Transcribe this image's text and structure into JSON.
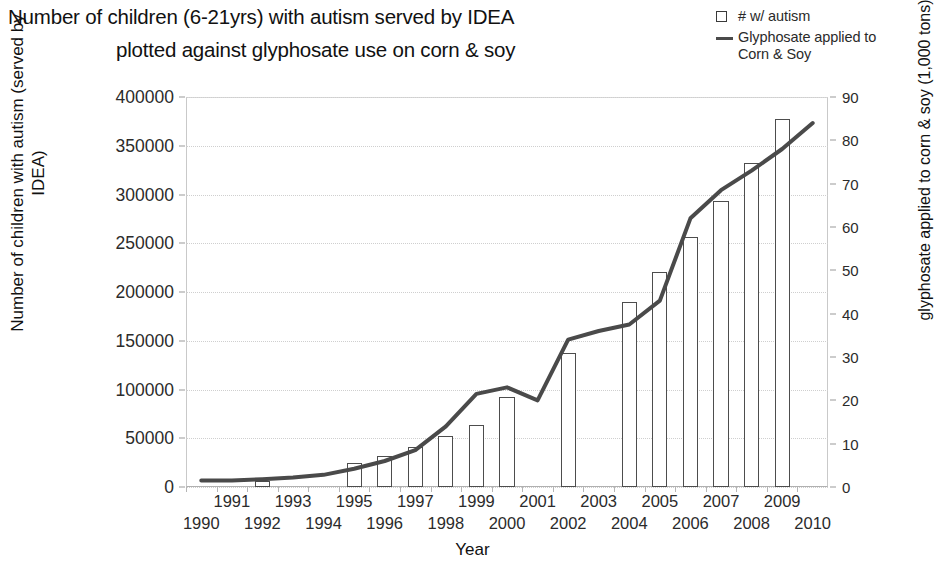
{
  "title": {
    "line1": "Number of children (6-21yrs) with autism served by IDEA",
    "line2": "plotted against glyphosate use on corn & soy"
  },
  "legend": {
    "items": [
      {
        "label": "# w/ autism",
        "marker": "open-square",
        "color": "#3a3a3a"
      },
      {
        "label": "Glyphosate applied to",
        "label2": "Corn & Soy",
        "marker": "line",
        "color": "#4a4a4a"
      }
    ]
  },
  "axes": {
    "x_title": "Year",
    "y_left_title": "Number of children with autism (served by IDEA)",
    "y_right_title": "glyphosate applied to corn & soy (1,000 tons)"
  },
  "chart_data": {
    "type": "bar",
    "title": "Number of children (6-21yrs) with autism served by IDEA plotted against glyphosate use on corn & soy",
    "xlabel": "Year",
    "ylabel": "Number of children with autism (served by IDEA)",
    "y2label": "glyphosate applied to corn & soy (1,000 tons)",
    "grid": true,
    "legend_position": "top-right",
    "categories": [
      1990,
      1991,
      1992,
      1993,
      1994,
      1995,
      1996,
      1997,
      1998,
      1999,
      2000,
      2001,
      2002,
      2003,
      2004,
      2005,
      2006,
      2007,
      2008,
      2009,
      2010
    ],
    "x_tick_labels": [
      "1990",
      "1991",
      "1992",
      "1993",
      "1994",
      "1995",
      "1996",
      "1997",
      "1998",
      "1999",
      "2000",
      "2001",
      "2002",
      "2003",
      "2004",
      "2005",
      "2006",
      "2007",
      "2008",
      "2009",
      "2010"
    ],
    "ylim": [
      0,
      400000
    ],
    "y_ticks": [
      0,
      50000,
      100000,
      150000,
      200000,
      250000,
      300000,
      350000,
      400000
    ],
    "y_tick_labels": [
      "0",
      "50000",
      "100000",
      "150000",
      "200000",
      "250000",
      "300000",
      "350000",
      "400000"
    ],
    "y2lim": [
      0,
      90
    ],
    "y2_ticks": [
      0,
      10,
      20,
      30,
      40,
      50,
      60,
      70,
      80,
      90
    ],
    "y2_tick_labels": [
      "0",
      "10",
      "20",
      "30",
      "40",
      "50",
      "60",
      "70",
      "80",
      "90"
    ],
    "series": [
      {
        "name": "# w/ autism",
        "type": "bar",
        "axis": "left",
        "units": "children",
        "values": [
          0,
          0,
          6000,
          0,
          0,
          25000,
          32000,
          41000,
          52000,
          64000,
          92000,
          0,
          137000,
          0,
          190000,
          221000,
          256000,
          293000,
          332000,
          377000,
          0
        ]
      },
      {
        "name": "Glyphosate applied to Corn & Soy",
        "type": "line",
        "axis": "right",
        "units": "1,000 tons",
        "values": [
          1.5,
          1.5,
          1.8,
          2.2,
          2.8,
          4.2,
          6.0,
          8.5,
          14.0,
          21.5,
          23.0,
          20.0,
          34.0,
          36.0,
          37.5,
          43.0,
          62.0,
          68.5,
          73.0,
          78.0,
          84.0
        ]
      }
    ]
  }
}
